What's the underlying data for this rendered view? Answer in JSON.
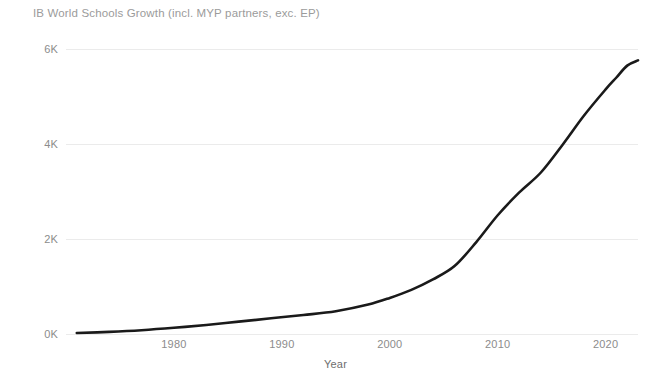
{
  "chart_data": {
    "type": "line",
    "title": "IB World Schools Growth (incl. MYP partners, exc. EP)",
    "xlabel": "Year",
    "ylabel": "",
    "xlim": [
      1970,
      2023
    ],
    "ylim": [
      0,
      6000
    ],
    "grid": true,
    "legend": false,
    "line_color": "#1a1a1a",
    "grid_color": "#ebebeb",
    "title_color": "#9b9b9b",
    "tick_color": "#8c8c8c",
    "x_ticks": [
      1980,
      1990,
      2000,
      2010,
      2020
    ],
    "x_tick_labels": [
      "1980",
      "1990",
      "2000",
      "2010",
      "2020"
    ],
    "y_ticks": [
      0,
      2000,
      4000,
      6000
    ],
    "y_tick_labels": [
      "0K",
      "2K",
      "4K",
      "6K"
    ],
    "series": [
      {
        "name": "IB World Schools",
        "x": [
          1971,
          1974,
          1977,
          1980,
          1983,
          1986,
          1989,
          1992,
          1995,
          1998,
          2000,
          2002,
          2004,
          2006,
          2008,
          2010,
          2012,
          2014,
          2016,
          2018,
          2020,
          2021,
          2022,
          2023
        ],
        "values": [
          20,
          45,
          80,
          130,
          190,
          260,
          330,
          400,
          480,
          620,
          760,
          930,
          1150,
          1430,
          1930,
          2500,
          2980,
          3400,
          3980,
          4600,
          5150,
          5400,
          5650,
          5760
        ]
      }
    ]
  }
}
